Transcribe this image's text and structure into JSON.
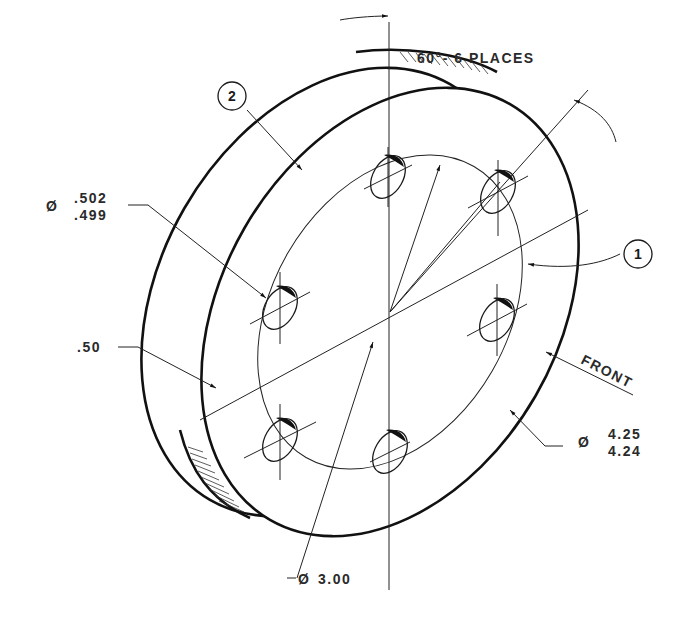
{
  "drawing": {
    "type": "isometric technical drawing",
    "subject": "flange plate with 6 holes"
  },
  "annotations": {
    "angle_note": "60°- 6 PLACES",
    "hole_diameter": {
      "symbol": "Ø",
      "upper": ".502",
      "lower": ".499"
    },
    "thickness": ".50",
    "outer_diameter": {
      "symbol": "Ø",
      "upper": "4.25",
      "lower": "4.24"
    },
    "bolt_circle": {
      "symbol": "Ø",
      "value": "3.00"
    },
    "front_label": "FRONT"
  },
  "balloons": [
    {
      "number": "1"
    },
    {
      "number": "2"
    }
  ],
  "colors": {
    "line": "#111111",
    "text": "#2a2a2a",
    "background": "#ffffff"
  }
}
